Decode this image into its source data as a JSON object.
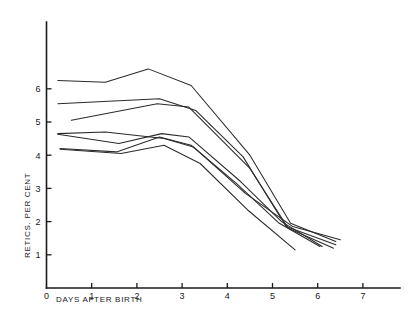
{
  "chart_data": {
    "type": "line",
    "title": "",
    "xlabel": "DAYS AFTER BIRTH",
    "ylabel": "RETICS. PER CENT",
    "xlim": [
      0,
      7.6
    ],
    "ylim": [
      0,
      6.9
    ],
    "xticks": [
      0,
      1,
      2,
      3,
      4,
      5,
      6,
      7
    ],
    "xticklabels": [
      "0",
      "1",
      "2",
      "3",
      "4",
      "5",
      "6",
      "7"
    ],
    "yticks": [
      1,
      2,
      3,
      4,
      5,
      6
    ],
    "yticklabels": [
      "1",
      "2",
      "3",
      "4",
      "5",
      "6"
    ],
    "grid": false,
    "legend": "none",
    "line_color": "#2b2b2b",
    "series": [
      {
        "name": "infant-1",
        "x": [
          0.25,
          1.3,
          2.25,
          3.2,
          4.5,
          5.4,
          6.4
        ],
        "y": [
          6.25,
          6.2,
          6.6,
          6.1,
          4.0,
          1.95,
          1.4
        ]
      },
      {
        "name": "infant-2",
        "x": [
          0.25,
          2.5,
          3.3,
          4.35,
          5.3,
          6.4
        ],
        "y": [
          5.55,
          5.7,
          5.35,
          3.95,
          1.85,
          1.3
        ]
      },
      {
        "name": "infant-3",
        "x": [
          0.55,
          2.45,
          3.15,
          4.5,
          5.35,
          6.35
        ],
        "y": [
          5.05,
          5.55,
          5.45,
          3.6,
          1.8,
          1.2
        ]
      },
      {
        "name": "infant-4",
        "x": [
          0.25,
          1.3,
          2.6,
          3.25,
          4.4,
          5.45,
          6.5
        ],
        "y": [
          4.65,
          4.7,
          4.5,
          4.25,
          2.85,
          1.85,
          1.45
        ]
      },
      {
        "name": "infant-5",
        "x": [
          0.25,
          1.6,
          2.55,
          3.15,
          4.3,
          5.2,
          6.1
        ],
        "y": [
          4.63,
          4.35,
          4.65,
          4.55,
          3.2,
          2.0,
          1.25
        ]
      },
      {
        "name": "infant-6",
        "x": [
          0.3,
          1.55,
          2.5,
          3.2,
          4.2,
          5.15,
          6.05
        ],
        "y": [
          4.2,
          4.1,
          4.55,
          4.3,
          3.15,
          1.95,
          1.25
        ]
      },
      {
        "name": "infant-7",
        "x": [
          0.3,
          1.65,
          2.6,
          3.4,
          4.45,
          5.5
        ],
        "y": [
          4.18,
          4.05,
          4.3,
          3.75,
          2.35,
          1.15
        ]
      }
    ]
  },
  "axes": {
    "x_axis_name": "days-after-birth-axis",
    "y_axis_name": "retics-per-cent-axis"
  }
}
